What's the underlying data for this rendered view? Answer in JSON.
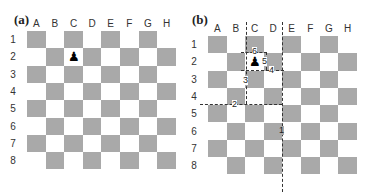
{
  "panels": [
    {
      "id": "a",
      "label": "(a)"
    },
    {
      "id": "b",
      "label": "(b)"
    }
  ],
  "columns": [
    "A",
    "B",
    "C",
    "D",
    "E",
    "F",
    "G",
    "H"
  ],
  "rows": [
    "1",
    "2",
    "3",
    "4",
    "5",
    "6",
    "7",
    "8"
  ],
  "colors": {
    "dark_square": "#a9a9a9",
    "light_square": "#ffffff",
    "dash": "#333333"
  },
  "pawn": {
    "glyph": "♟",
    "square": "C2"
  },
  "path_labels": [
    "1",
    "2",
    "3",
    "4",
    "5",
    "6"
  ]
}
